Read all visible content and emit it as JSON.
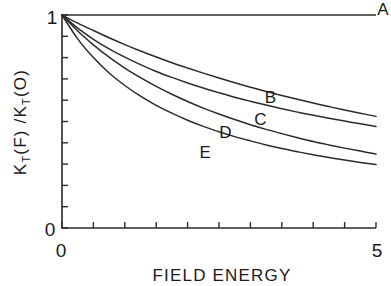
{
  "chart_data": {
    "type": "line",
    "title": "",
    "xlabel": "FIELD ENERGY",
    "ylabel": "K_T(F) / K_T(O)",
    "ylabel_parts": {
      "k1": "K",
      "sub1": "T",
      "p1": "(F) /",
      "k2": "K",
      "sub2": "T",
      "p2": "(O)"
    },
    "xlim": [
      0,
      5
    ],
    "ylim": [
      0,
      1
    ],
    "xticks": [
      0,
      5
    ],
    "xticklabels": [
      "0",
      "5"
    ],
    "yticks": [
      0,
      1
    ],
    "yticklabels": [
      "0",
      "1"
    ],
    "x_minor_step": 0.5,
    "y_minor_step": 0.1,
    "grid": false,
    "legend": "inline-curve-labels",
    "x": [
      0,
      0.25,
      0.5,
      0.75,
      1,
      1.25,
      1.5,
      1.75,
      2,
      2.25,
      2.5,
      2.75,
      3,
      3.25,
      3.5,
      3.75,
      4,
      4.25,
      4.5,
      4.75,
      5
    ],
    "series": [
      {
        "name": "A",
        "label": "A",
        "label_x": 5.02,
        "label_y": 1.0,
        "values": [
          1,
          1,
          1,
          1,
          1,
          1,
          1,
          1,
          1,
          1,
          1,
          1,
          1,
          1,
          1,
          1,
          1,
          1,
          1,
          1,
          1
        ]
      },
      {
        "name": "B",
        "label": "B",
        "label_x": 3.32,
        "label_y": 0.585,
        "values": [
          1.0,
          0.962,
          0.927,
          0.893,
          0.861,
          0.831,
          0.803,
          0.776,
          0.751,
          0.727,
          0.704,
          0.682,
          0.661,
          0.641,
          0.622,
          0.604,
          0.587,
          0.57,
          0.554,
          0.539,
          0.524
        ]
      },
      {
        "name": "C",
        "label": "C",
        "label_x": 3.16,
        "label_y": 0.485,
        "values": [
          1.0,
          0.938,
          0.886,
          0.841,
          0.802,
          0.767,
          0.735,
          0.707,
          0.681,
          0.657,
          0.635,
          0.614,
          0.595,
          0.577,
          0.56,
          0.544,
          0.529,
          0.515,
          0.502,
          0.489,
          0.477
        ]
      },
      {
        "name": "D",
        "label": "D",
        "label_x": 2.6,
        "label_y": 0.425,
        "values": [
          1.0,
          0.925,
          0.86,
          0.802,
          0.751,
          0.706,
          0.665,
          0.628,
          0.594,
          0.563,
          0.535,
          0.509,
          0.485,
          0.463,
          0.443,
          0.424,
          0.406,
          0.39,
          0.375,
          0.361,
          0.347
        ]
      },
      {
        "name": "E",
        "label": "E",
        "label_x": 2.28,
        "label_y": 0.33,
        "values": [
          1.0,
          0.888,
          0.8,
          0.728,
          0.669,
          0.619,
          0.576,
          0.539,
          0.506,
          0.477,
          0.452,
          0.429,
          0.409,
          0.39,
          0.373,
          0.358,
          0.344,
          0.331,
          0.319,
          0.308,
          0.298
        ]
      }
    ]
  },
  "axes": {
    "x_tick_min_label": "0",
    "x_tick_max_label": "5",
    "y_tick_min_label": "0",
    "y_tick_max_label": "1"
  }
}
